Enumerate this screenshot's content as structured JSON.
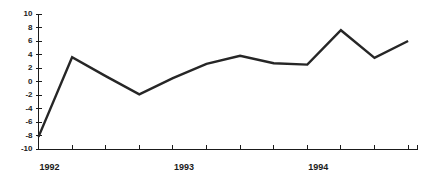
{
  "chart_data": {
    "type": "line",
    "title": "",
    "subtitle": "",
    "xlabel": "",
    "ylabel": "",
    "ylim": [
      -10,
      10
    ],
    "ytick_labels": [
      "10",
      "8",
      "6",
      "4",
      "2",
      "0",
      "-2",
      "-4",
      "-6",
      "-8",
      "-10"
    ],
    "ytick_values": [
      10,
      8,
      6,
      4,
      2,
      0,
      -2,
      -4,
      -6,
      -8,
      -10
    ],
    "grid": false,
    "legend": null,
    "x_axis_type": "time-quarterly",
    "xtick_labels": [
      "1992",
      "1993",
      "1994"
    ],
    "xtick_label_values": [
      1992,
      1993,
      1994
    ],
    "x_minor_tick_count": 12,
    "categories": [
      "1992 Q1",
      "1992 Q2",
      "1992 Q3",
      "1992 Q4",
      "1993 Q1",
      "1993 Q2",
      "1993 Q3",
      "1993 Q4",
      "1994 Q1",
      "1994 Q2",
      "1994 Q3",
      "1994 Q4"
    ],
    "x": [
      0,
      1,
      2,
      3,
      4,
      5,
      6,
      7,
      8,
      9,
      10,
      11
    ],
    "values": [
      -8.2,
      3.6,
      0.8,
      -1.9,
      0.5,
      2.6,
      3.8,
      2.7,
      2.5,
      7.6,
      3.5,
      6.0
    ],
    "line_color": "#262626",
    "background_color": "#ffffff",
    "axis_color": "#1a1a1a"
  }
}
